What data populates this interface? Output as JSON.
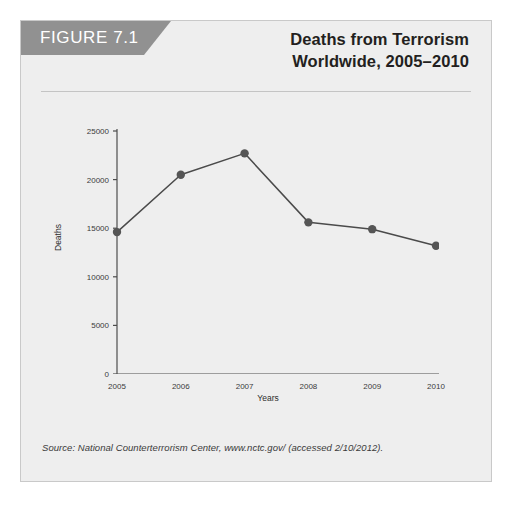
{
  "figure": {
    "tab_label": "FIGURE 7.1",
    "title_line1": "Deaths from Terrorism",
    "title_line2": "Worldwide, 2005–2010",
    "source": "Source: National Counterterrorism Center, www.nctc.gov/ (accessed 2/10/2012).",
    "panel_bg": "#eeeeee",
    "tab_color": "#919191",
    "line_color": "#4a4a4a",
    "marker_color": "#555555",
    "axis_color": "#4d4d4d"
  },
  "chart_data": {
    "type": "line",
    "title": "Deaths from Terrorism Worldwide, 2005–2010",
    "xlabel": "Years",
    "ylabel": "Deaths",
    "categories": [
      "2005",
      "2006",
      "2007",
      "2008",
      "2009",
      "2010"
    ],
    "x": [
      2005,
      2006,
      2007,
      2008,
      2009,
      2010
    ],
    "values": [
      14600,
      20500,
      22700,
      15600,
      14900,
      13200
    ],
    "series": [
      {
        "name": "Deaths",
        "values": [
          14600,
          20500,
          22700,
          15600,
          14900,
          13200
        ]
      }
    ],
    "xlim": [
      2005,
      2010
    ],
    "ylim": [
      0,
      25000
    ],
    "ytick_labels": [
      "0",
      "5000",
      "10000",
      "15000",
      "20000",
      "25000"
    ],
    "ytick_values": [
      0,
      5000,
      10000,
      15000,
      20000,
      25000
    ],
    "xtick_labels": [
      "2005",
      "2006",
      "2007",
      "2008",
      "2009",
      "2010"
    ],
    "grid": false,
    "legend": "none",
    "markers": "filled-circle"
  }
}
